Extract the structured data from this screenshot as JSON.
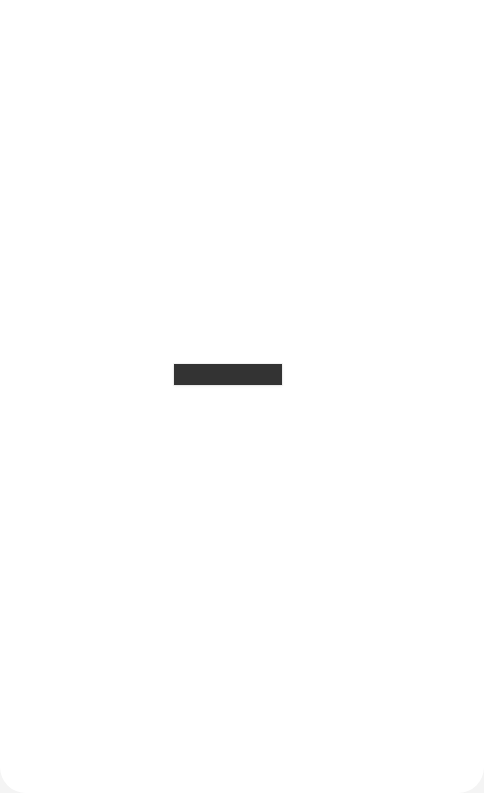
{
  "screen": {
    "background_color": "#ffffff",
    "placeholder": {
      "text": "",
      "color": "#333333"
    }
  }
}
